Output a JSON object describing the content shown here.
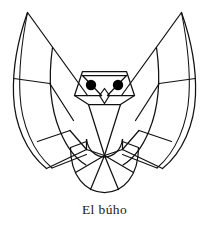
{
  "page": {
    "background_color": "#ffffff",
    "width": 209,
    "height": 225
  },
  "caption": {
    "text": "El búho",
    "color": "#1a1a1a",
    "align": "center"
  },
  "illustration": {
    "title": "El búho",
    "subject": "owl",
    "style": "geometric line art",
    "line_color": "#111111",
    "fill_color": "#ffffff",
    "eye_color": "#000000",
    "parts": {
      "left_wing": "left-wing",
      "right_wing": "right-wing",
      "head": "owl-head",
      "left_eye": "left-eye",
      "right_eye": "right-eye",
      "beak": "beak",
      "body": "owl-body",
      "tail": "tail-fan"
    }
  }
}
